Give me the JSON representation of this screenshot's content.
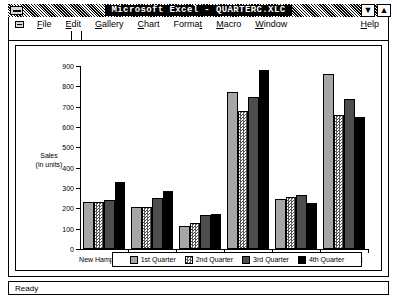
{
  "window": {
    "title": "Microsoft Excel - QUARTERC.XLC",
    "system_menu_icon": "system-menu-icon",
    "minimize_icon": "▼",
    "maximize_icon": "▲",
    "document_system_menu_icon": "document-system-menu-icon"
  },
  "menubar": {
    "items": [
      {
        "label": "File",
        "accel": "F"
      },
      {
        "label": "Edit",
        "accel": "E"
      },
      {
        "label": "Gallery",
        "accel": "G"
      },
      {
        "label": "Chart",
        "accel": "C"
      },
      {
        "label": "Format",
        "accel": "t"
      },
      {
        "label": "Macro",
        "accel": "M"
      },
      {
        "label": "Window",
        "accel": "W"
      }
    ],
    "help": {
      "label": "Help",
      "accel": "H"
    }
  },
  "statusbar": {
    "text": "Ready"
  },
  "colors": {
    "q1": "#a6a6a6",
    "q2": "#ffffff",
    "q3": "#4d4d4d",
    "q4": "#000000",
    "axis": "#000000",
    "titlebar": "#000000"
  },
  "chart_data": {
    "type": "bar",
    "title": "",
    "xlabel": "",
    "ylabel": "Sales\n(in units)",
    "ylabel_line1": "Sales",
    "ylabel_line2": "(in units)",
    "ylim": [
      0,
      900
    ],
    "ytick_step": 100,
    "yticks": [
      0,
      100,
      200,
      300,
      400,
      500,
      600,
      700,
      800,
      900
    ],
    "grid": false,
    "legend_position": "bottom",
    "categories": [
      "New Hampshire",
      "Vermont",
      "Maine",
      "Massachusetts",
      "Rhode Island",
      "Connecticut"
    ],
    "series": [
      {
        "name": "1st Quarter",
        "values": [
          230,
          205,
          115,
          770,
          245,
          860
        ]
      },
      {
        "name": "2nd Quarter",
        "values": [
          230,
          205,
          130,
          680,
          255,
          660
        ]
      },
      {
        "name": "3rd Quarter",
        "values": [
          240,
          250,
          165,
          750,
          265,
          740
        ]
      },
      {
        "name": "4th Quarter",
        "values": [
          330,
          285,
          170,
          880,
          225,
          650
        ]
      }
    ]
  }
}
